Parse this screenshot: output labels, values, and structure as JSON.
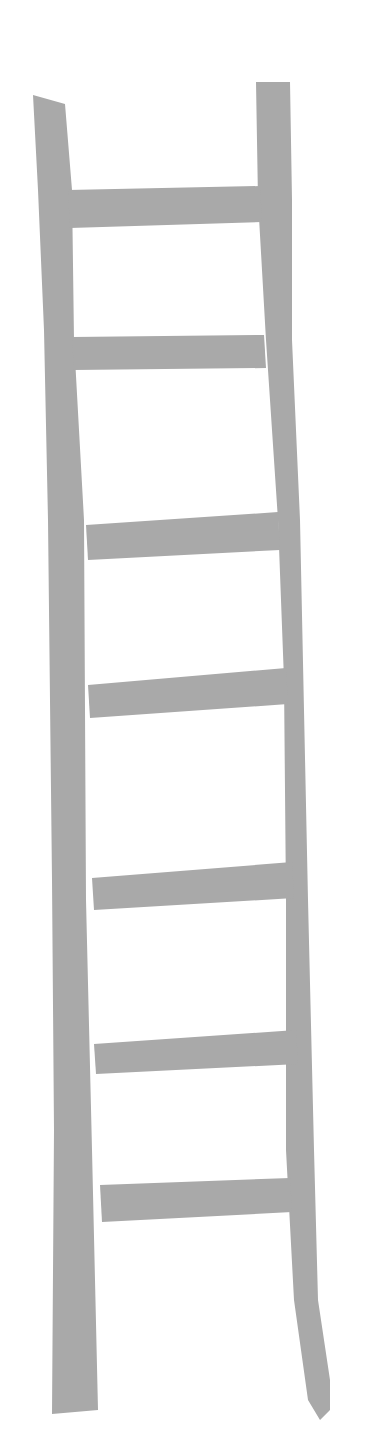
{
  "illustration": {
    "subject": "ladder",
    "color": "#a9a9a9",
    "background": "#ffffff",
    "rungs": 8
  }
}
